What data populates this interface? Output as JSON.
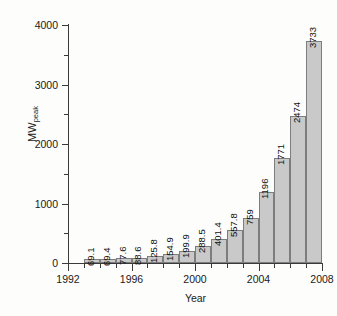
{
  "chart_data": {
    "type": "bar",
    "title": "",
    "subtitle": "",
    "xlabel": "Year",
    "ylabel": "MWpeak",
    "ylabel_base": "MW",
    "ylabel_sub": "peak",
    "categories": [
      1993,
      1994,
      1995,
      1996,
      1997,
      1998,
      1999,
      2000,
      2001,
      2002,
      2003,
      2004,
      2005,
      2006,
      2007
    ],
    "values": [
      69.1,
      69.4,
      77.6,
      88.6,
      125.8,
      154.9,
      199.9,
      288.5,
      401.4,
      557.8,
      759,
      1196,
      1771,
      2474,
      3733
    ],
    "data_labels": [
      "69.1",
      "69.4",
      "77.6",
      "88.6",
      "125.8",
      "154.9",
      "199.9",
      "288.5",
      "401.4",
      "557.8",
      "759",
      "1196",
      "1771",
      "2474",
      "3733"
    ],
    "ylim": [
      0,
      4000
    ],
    "xlim": [
      1992,
      2008
    ],
    "ytick_values": [
      0,
      1000,
      2000,
      3000,
      4000
    ],
    "ytick_labels": [
      "0",
      "1000",
      "2000",
      "3000",
      "4000"
    ],
    "yminor_values": [
      500,
      1500,
      2500,
      3500
    ],
    "xtick_values": [
      1992,
      1996,
      2000,
      2004,
      2008
    ],
    "xtick_labels": [
      "1992",
      "1996",
      "2000",
      "2004",
      "2008"
    ],
    "xminor_values": [
      1993,
      1994,
      1995,
      1997,
      1998,
      1999,
      2001,
      2002,
      2003,
      2005,
      2006,
      2007
    ],
    "grid": false,
    "legend": false,
    "legend_position": "none",
    "bar_fill_color": "#c9c9c9",
    "bar_edge_color": "#7d7d7d",
    "axis_color": "#3a3a3a",
    "background_color": "#fdfdfb",
    "data_label_rotation": 90
  }
}
